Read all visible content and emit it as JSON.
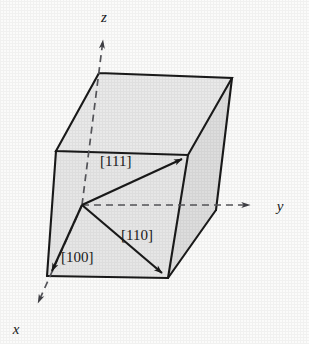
{
  "figure": {
    "kind": "crystallographic-unit-cell-diagram",
    "background_color": "#fbfbfa",
    "face_fill_color": "#e6e6e6",
    "line_color": "#1a1a1a",
    "dashed_color": "#55555a"
  },
  "axes": [
    {
      "id": "z",
      "label": "z",
      "style": "dashed-with-arrow",
      "label_x": 104,
      "label_y": 22,
      "from_x": 82,
      "from_y": 205,
      "to_x": 103,
      "to_y": 33
    },
    {
      "id": "y",
      "label": "y",
      "style": "dashed-with-arrow",
      "label_x": 282,
      "label_y": 210,
      "from_x": 82,
      "from_y": 205,
      "to_x": 258,
      "to_y": 205
    },
    {
      "id": "x",
      "label": "x",
      "style": "dashed-with-arrow",
      "label_x": 14,
      "label_y": 334,
      "from_x": 82,
      "from_y": 205,
      "to_x": 34,
      "to_y": 312
    }
  ],
  "directions": [
    {
      "id": "111",
      "label": "[111]",
      "label_x": 100,
      "label_y": 166,
      "from_x": 82,
      "from_y": 205,
      "to_x": 188,
      "to_y": 156
    },
    {
      "id": "110",
      "label": "[110]",
      "label_x": 121,
      "label_y": 240,
      "from_x": 82,
      "from_y": 205,
      "to_x": 167,
      "to_y": 277
    },
    {
      "id": "100",
      "label": "[100]",
      "label_x": 61,
      "label_y": 262,
      "from_x": 82,
      "from_y": 205,
      "to_x": 48,
      "to_y": 276
    }
  ],
  "cube": {
    "vertices": {
      "top_back_left": {
        "x": 99,
        "y": 73
      },
      "top_back_right": {
        "x": 232,
        "y": 78
      },
      "top_front_right": {
        "x": 188,
        "y": 155
      },
      "top_front_left": {
        "x": 56,
        "y": 151
      },
      "bottom_back_left": {
        "x": 82,
        "y": 205
      },
      "bottom_back_right": {
        "x": 216,
        "y": 210
      },
      "bottom_front_right": {
        "x": 168,
        "y": 278
      },
      "bottom_front_left": {
        "x": 47,
        "y": 276
      }
    }
  }
}
